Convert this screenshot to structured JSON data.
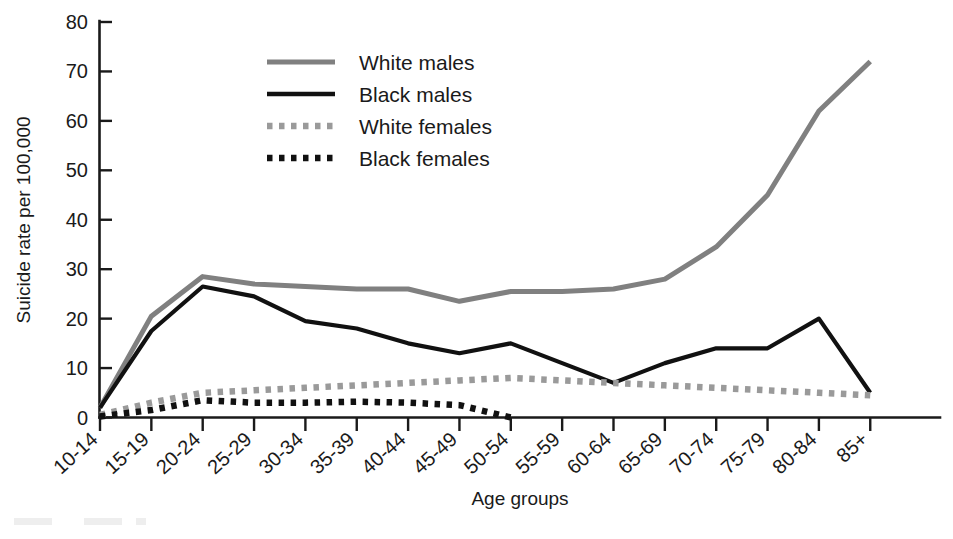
{
  "chart_data": {
    "type": "line",
    "title": "",
    "xlabel": "Age groups",
    "ylabel": "Suicide rate per 100,000",
    "categories": [
      "10-14",
      "15-19",
      "20-24",
      "25-29",
      "30-34",
      "35-39",
      "40-44",
      "45-49",
      "50-54",
      "55-59",
      "60-64",
      "65-69",
      "70-74",
      "75-79",
      "80-84",
      "85+"
    ],
    "ylim": [
      0,
      80
    ],
    "yticks": [
      0,
      10,
      20,
      30,
      40,
      50,
      60,
      70,
      80
    ],
    "ytick_labels": [
      "0",
      "10",
      "20",
      "30",
      "40",
      "50",
      "60",
      "70",
      "80"
    ],
    "grid": false,
    "legend_position": "upper-left-inside",
    "series": [
      {
        "name": "White males",
        "color": "#808080",
        "style": "solid",
        "values": [
          2,
          20.5,
          28.5,
          27,
          26.5,
          26,
          26,
          23.5,
          25.5,
          25.5,
          26,
          28,
          34.5,
          45,
          62,
          72
        ]
      },
      {
        "name": "Black males",
        "color": "#111111",
        "style": "solid",
        "values": [
          2,
          17.5,
          26.5,
          24.5,
          19.5,
          18,
          15,
          13,
          15,
          11,
          7,
          11,
          14,
          14,
          20,
          5
        ]
      },
      {
        "name": "White females",
        "color": "#9a9a9a",
        "style": "dotted",
        "values": [
          0.5,
          3,
          5,
          5.5,
          6,
          6.5,
          7,
          7.5,
          8,
          7.5,
          7,
          6.5,
          6,
          5.5,
          5,
          4.5
        ]
      },
      {
        "name": "Black females",
        "color": "#111111",
        "style": "dotted",
        "values": [
          0.2,
          1.5,
          3.5,
          3,
          3,
          3.2,
          3,
          2.5,
          0,
          null,
          null,
          null,
          null,
          null,
          null,
          null
        ]
      }
    ]
  },
  "legend": {
    "items": [
      {
        "label": "White males"
      },
      {
        "label": "Black males"
      },
      {
        "label": "White females"
      },
      {
        "label": "Black females"
      }
    ]
  },
  "axes": {
    "y_title": "Suicide rate per 100,000",
    "x_title": "Age groups"
  }
}
